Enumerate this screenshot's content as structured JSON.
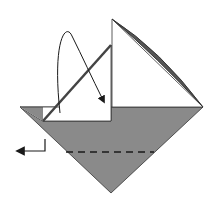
{
  "diagram": {
    "type": "origami-fold-step",
    "colors": {
      "background": "#ffffff",
      "paper_color_side": "#8a8a8a",
      "paper_white_side": "#ffffff",
      "line": "#1a1a1a",
      "edge_shadow": "#555555"
    },
    "elements": {
      "grey_lower_triangle": "colored side of paper, lower half of diamond",
      "white_right_flap": "white triangular flap standing up on the right",
      "white_left_flap": "white flap on the left being folded",
      "curved_arrow": "valley-fold arrow: fold left flap over to the right",
      "valley_fold_line": "dashed line across the grey triangle",
      "turn_arrow": "arrow indicating direction to the left"
    }
  }
}
